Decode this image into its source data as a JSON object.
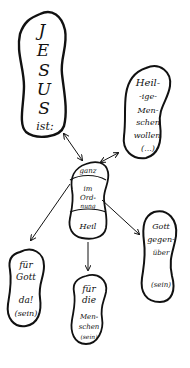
{
  "diagram": {
    "type": "hand-drawn concept map",
    "colors": {
      "ink": "#111111",
      "background": "#ffffff"
    },
    "nodes": {
      "jesus": {
        "lines": [
          "J",
          "E",
          "S",
          "U",
          "S",
          "ist:"
        ]
      },
      "heilige": {
        "lines": [
          "Heil-",
          "-ige-",
          "Men-",
          "schen",
          "wollen",
          "(...)"
        ]
      },
      "center": {
        "top": "ganz",
        "middle": [
          "im",
          "Ord-",
          "nung"
        ],
        "bottom": "Heil"
      },
      "fuer_gott": {
        "lines": [
          "für",
          "Gott",
          "da!",
          "(sein)"
        ]
      },
      "fuer_menschen": {
        "lines": [
          "für",
          "die",
          "Men-",
          "schen",
          "(sein)"
        ]
      },
      "gott_gegenueber": {
        "lines": [
          "Gott",
          "gegen-",
          "über",
          "(sein)"
        ]
      }
    },
    "edges": [
      {
        "from": "center",
        "to": "jesus",
        "style": "double-arrow"
      },
      {
        "from": "center",
        "to": "heilige",
        "style": "double-arrow"
      },
      {
        "from": "center",
        "to": "fuer_gott",
        "style": "arrow"
      },
      {
        "from": "center",
        "to": "fuer_menschen",
        "style": "arrow"
      },
      {
        "from": "center",
        "to": "gott_gegenueber",
        "style": "arrow"
      }
    ]
  }
}
